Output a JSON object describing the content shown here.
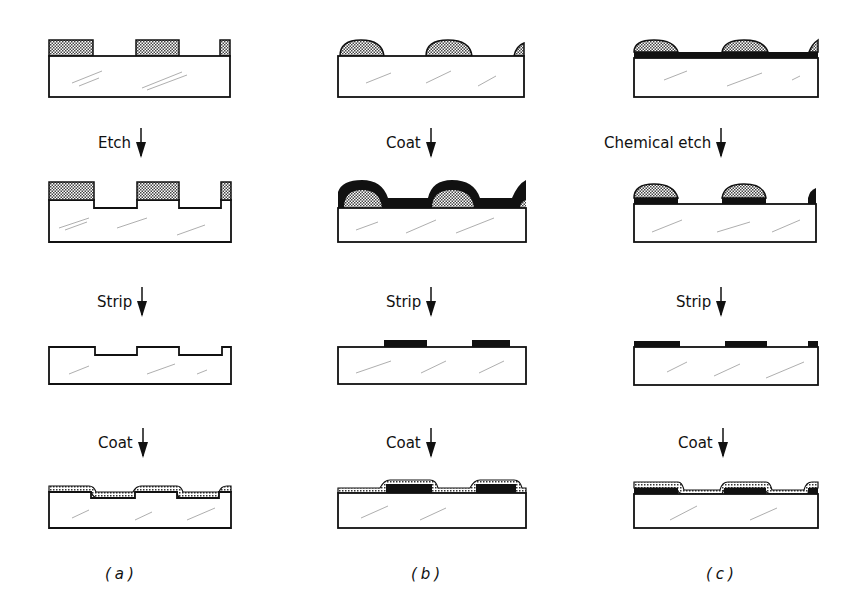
{
  "figure": {
    "columns": [
      {
        "id": "a",
        "caption": "(a)",
        "steps": [
          {
            "label": "",
            "state": "Substrate with patterned resist (rectangular)"
          },
          {
            "label": "Etch",
            "state": "Substrate etched between resist blocks"
          },
          {
            "label": "Strip",
            "state": "Resist removed, grooved substrate"
          },
          {
            "label": "Coat",
            "state": "Conformal coating over grooved substrate"
          }
        ]
      },
      {
        "id": "b",
        "caption": "(b)",
        "steps": [
          {
            "label": "",
            "state": "Substrate with reflowed (rounded) resist"
          },
          {
            "label": "Coat",
            "state": "Dark film coated over resist and substrate"
          },
          {
            "label": "Strip",
            "state": "Lift-off leaves dark film islands"
          },
          {
            "label": "Coat",
            "state": "Conformal coating over film islands"
          }
        ]
      },
      {
        "id": "c",
        "caption": "(c)",
        "steps": [
          {
            "label": "",
            "state": "Substrate with dark film and rounded resist"
          },
          {
            "label": "Chemical etch",
            "state": "Film etched except under resist"
          },
          {
            "label": "Strip",
            "state": "Resist removed, film pattern remains"
          },
          {
            "label": "Coat",
            "state": "Conformal coating over film pattern"
          }
        ]
      }
    ],
    "colors": {
      "outline": "#111111",
      "film": "#111111",
      "resist_fill": "#bdbdbd",
      "background": "#ffffff"
    }
  }
}
